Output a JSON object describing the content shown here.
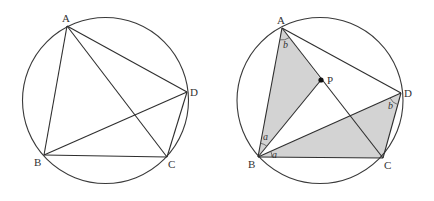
{
  "figures": [
    {
      "id": "left",
      "circle": {
        "cx": 105.5,
        "cy": 100.5,
        "r": 83
      },
      "points": {
        "A": {
          "x": 67,
          "y": 26,
          "label": "A",
          "lx": 62,
          "ly": 22
        },
        "B": {
          "x": 44,
          "y": 155,
          "label": "B",
          "lx": 34,
          "ly": 166
        },
        "C": {
          "x": 167,
          "y": 157,
          "label": "C",
          "lx": 168,
          "ly": 168
        },
        "D": {
          "x": 187,
          "y": 92,
          "label": "D",
          "lx": 190,
          "ly": 96
        }
      },
      "segments": [
        [
          "A",
          "B"
        ],
        [
          "A",
          "C"
        ],
        [
          "A",
          "D"
        ],
        [
          "B",
          "C"
        ],
        [
          "B",
          "D"
        ],
        [
          "C",
          "D"
        ]
      ]
    },
    {
      "id": "right",
      "circle": {
        "cx": 320,
        "cy": 100.5,
        "r": 83
      },
      "points": {
        "A": {
          "x": 282,
          "y": 28,
          "label": "A",
          "lx": 277,
          "ly": 24
        },
        "B": {
          "x": 258,
          "y": 157,
          "label": "B",
          "lx": 248,
          "ly": 168
        },
        "C": {
          "x": 383,
          "y": 158,
          "label": "C",
          "lx": 384,
          "ly": 169
        },
        "D": {
          "x": 401,
          "y": 93,
          "label": "D",
          "lx": 404,
          "ly": 97
        },
        "P": {
          "x": 321,
          "y": 80,
          "label": "P",
          "lx": 327,
          "ly": 84
        }
      },
      "shaded_triangles": [
        [
          "A",
          "B",
          "P"
        ],
        [
          "B",
          "C",
          "D"
        ]
      ],
      "segments": [
        [
          "A",
          "B"
        ],
        [
          "A",
          "C"
        ],
        [
          "A",
          "D"
        ],
        [
          "B",
          "C"
        ],
        [
          "B",
          "D"
        ],
        [
          "C",
          "D"
        ],
        [
          "B",
          "P"
        ]
      ],
      "angle_labels": [
        {
          "text": "b",
          "x": 283,
          "y": 48
        },
        {
          "text": "a",
          "x": 263,
          "y": 140
        },
        {
          "text": "a",
          "x": 272,
          "y": 158
        },
        {
          "text": "b",
          "x": 388,
          "y": 109
        }
      ],
      "angle_arcs": [
        {
          "at": "A",
          "from": "B",
          "to": "P",
          "r": 12
        },
        {
          "at": "B",
          "from": "A",
          "to": "P",
          "r": 14
        },
        {
          "at": "B",
          "from": "D",
          "to": "C",
          "r": 14
        },
        {
          "at": "D",
          "from": "B",
          "to": "C",
          "r": 12
        }
      ]
    }
  ]
}
